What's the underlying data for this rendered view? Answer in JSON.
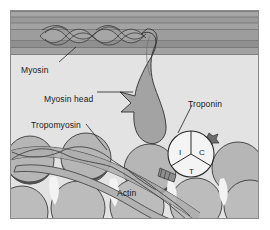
{
  "figure": {
    "background_color": "#ffffff",
    "frame": {
      "x": 10,
      "y": 10,
      "width": 249,
      "height": 209,
      "border_color": "#8a8a8a"
    },
    "palette": {
      "thick_filament": "#9b9b9b",
      "thick_filament_dark": "#7e7e7e",
      "cytosol": "#e3e3e3",
      "myosin_head": "#a0a0a0",
      "actin": "#b4b4b4",
      "actin_shadow": "#4d4d4d",
      "tropomyosin": "#adadad",
      "troponin_fill": "#f2f2f2",
      "outline": "#2b2b2b",
      "label_text": "#1a1a1a"
    }
  },
  "labels": [
    {
      "id": "myosin",
      "text": "Myosin",
      "x": 21,
      "y": 66,
      "leader": true
    },
    {
      "id": "myosin-head",
      "text": "Myosin head",
      "x": 44,
      "y": 95,
      "leader": true
    },
    {
      "id": "tropomyosin",
      "text": "Tropomyosin",
      "x": 31,
      "y": 121,
      "leader": true
    },
    {
      "id": "troponin",
      "text": "Troponin",
      "x": 188,
      "y": 100,
      "leader": true
    },
    {
      "id": "actin",
      "text": "Actin",
      "x": 117,
      "y": 189,
      "leader": false
    }
  ],
  "troponin": {
    "center_x": 191,
    "center_y": 154,
    "radius": 23,
    "subunits": [
      {
        "code": "I",
        "name": "troponin-I",
        "x": 179,
        "y": 149
      },
      {
        "code": "C",
        "name": "troponin-C",
        "x": 199,
        "y": 149
      },
      {
        "code": "T",
        "name": "troponin-T",
        "x": 189,
        "y": 168
      }
    ],
    "marker": {
      "name": "calcium-burst",
      "x": 211,
      "y": 138
    }
  },
  "structures": {
    "thick_filament_label": "thick filament band",
    "helix_label": "myosin tail coiled-coil",
    "head_label": "myosin head",
    "actin_label": "actin monomer",
    "tropomyosin_label": "tropomyosin strand"
  }
}
